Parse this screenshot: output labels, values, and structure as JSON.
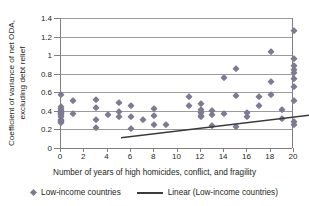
{
  "chart_data": {
    "type": "scatter",
    "title": "",
    "xlabel": "Number of years of high homicides, conflict, and fragility",
    "ylabel_line1": "Coefficient of variance of net ODA,",
    "ylabel_line2": "excluding debt relief",
    "xlim": [
      0,
      20
    ],
    "ylim": [
      0,
      1.4
    ],
    "xticks": [
      "0",
      "2",
      "4",
      "6",
      "8",
      "10",
      "12",
      "14",
      "16",
      "18",
      "20"
    ],
    "xtick_values": [
      0,
      2,
      4,
      6,
      8,
      10,
      12,
      14,
      16,
      18,
      20
    ],
    "yticks": [
      "0",
      "0.2",
      "0.4",
      "0.6",
      "0.8",
      "1",
      "1.2",
      "1.4"
    ],
    "ytick_values": [
      0,
      0.2,
      0.4,
      0.6,
      0.8,
      1,
      1.2,
      1.4
    ],
    "grid": "horizontal",
    "legend_position": "bottom",
    "marker_color": "#7f7a92",
    "line_color": "#3b3b3b",
    "grid_color": "#9b9b9b",
    "axis_color": "#808080",
    "series": [
      {
        "name": "Low-income countries",
        "type": "scatter",
        "marker": "diamond",
        "points": [
          [
            0,
            0.57
          ],
          [
            0,
            0.44
          ],
          [
            0,
            0.42
          ],
          [
            0,
            0.4
          ],
          [
            0,
            0.39
          ],
          [
            0,
            0.38
          ],
          [
            0,
            0.37
          ],
          [
            0,
            0.36
          ],
          [
            0,
            0.33
          ],
          [
            0,
            0.3
          ],
          [
            0,
            0.29
          ],
          [
            0,
            0.28
          ],
          [
            0,
            0.27
          ],
          [
            1,
            0.51
          ],
          [
            1,
            0.365
          ],
          [
            3,
            0.52
          ],
          [
            3,
            0.43
          ],
          [
            3,
            0.3
          ],
          [
            3,
            0.215
          ],
          [
            4,
            0.355
          ],
          [
            5,
            0.485
          ],
          [
            5,
            0.39
          ],
          [
            5,
            0.335
          ],
          [
            6,
            0.45
          ],
          [
            6,
            0.335
          ],
          [
            6,
            0.2
          ],
          [
            7,
            0.3
          ],
          [
            8,
            0.425
          ],
          [
            8,
            0.345
          ],
          [
            8,
            0.245
          ],
          [
            9,
            0.25
          ],
          [
            11,
            0.55
          ],
          [
            11,
            0.455
          ],
          [
            12,
            0.475
          ],
          [
            12,
            0.405
          ],
          [
            12,
            0.375
          ],
          [
            12,
            0.345
          ],
          [
            12,
            0.335
          ],
          [
            13,
            0.4
          ],
          [
            13,
            0.355
          ],
          [
            13,
            0.235
          ],
          [
            14,
            0.75
          ],
          [
            14,
            0.37
          ],
          [
            15,
            0.855
          ],
          [
            15,
            0.56
          ],
          [
            15,
            0.225
          ],
          [
            16,
            0.38
          ],
          [
            16,
            0.335
          ],
          [
            17,
            0.545
          ],
          [
            17,
            0.45
          ],
          [
            18,
            1.035
          ],
          [
            18,
            0.71
          ],
          [
            18,
            0.575
          ],
          [
            19,
            0.41
          ],
          [
            19,
            0.31
          ],
          [
            20,
            1.255
          ],
          [
            20,
            0.955
          ],
          [
            20,
            0.885
          ],
          [
            20,
            0.835
          ],
          [
            20,
            0.805
          ],
          [
            20,
            0.745
          ],
          [
            20,
            0.66
          ],
          [
            20,
            0.51
          ],
          [
            20,
            0.285
          ],
          [
            20,
            0.25
          ]
        ]
      },
      {
        "name": "Linear (Low-income countries)",
        "type": "line",
        "x": [
          0,
          20
        ],
        "y": [
          0.305,
          0.605
        ],
        "slope": 0.015,
        "intercept": 0.305
      }
    ]
  },
  "legend": {
    "scatter_label": "Low-income countries",
    "line_label": "Linear (Low-income countries)"
  }
}
